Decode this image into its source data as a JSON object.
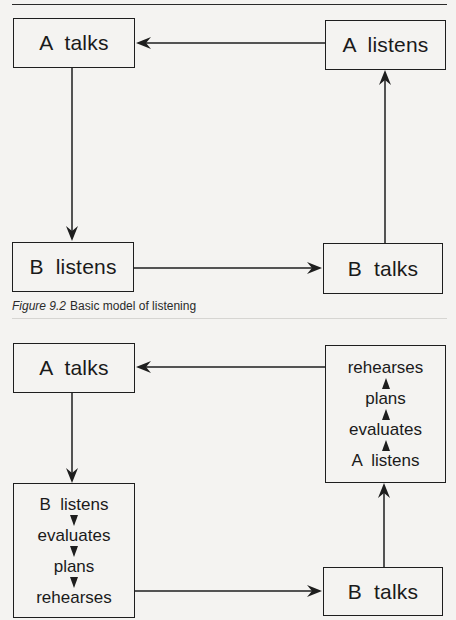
{
  "figure_top": {
    "boxes": {
      "a_talks": "A  talks",
      "a_listens": "A  listens",
      "b_listens": "B  listens",
      "b_talks": "B  talks"
    },
    "caption": {
      "number": "Figure 9.2",
      "title": "Basic model of listening"
    }
  },
  "figure_bottom": {
    "boxes": {
      "a_talks": "A  talks",
      "b_talks": "B  talks"
    },
    "b_stack": [
      "B  listens",
      "evaluates",
      "plans",
      "rehearses"
    ],
    "a_stack": [
      "rehearses",
      "plans",
      "evaluates",
      "A  listens"
    ]
  },
  "colors": {
    "paper": "#f4f3f1",
    "ink": "#1e1e1e"
  }
}
